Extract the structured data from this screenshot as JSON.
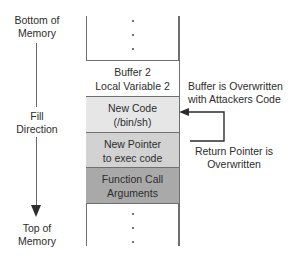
{
  "diagram": {
    "left_labels": {
      "bottom_of_memory": [
        "Bottom of",
        "Memory"
      ],
      "fill_direction": [
        "Fill",
        "Direction"
      ],
      "top_of_memory": [
        "Top of",
        "Memory"
      ]
    },
    "stack": [
      {
        "id": "buffer",
        "lines": [
          "Buffer 2",
          "Local Variable 2"
        ],
        "fill": "#ffffff"
      },
      {
        "id": "new-code",
        "lines": [
          "New Code",
          "(/bin/sh)"
        ],
        "fill": "#e6e6e6"
      },
      {
        "id": "new-pointer",
        "lines": [
          "New Pointer",
          "to exec code"
        ],
        "fill": "#d2d2d2"
      },
      {
        "id": "function-args",
        "lines": [
          "Function Call",
          "Arguments"
        ],
        "fill": "#a9a9a9"
      }
    ],
    "ellipsis": ".",
    "annotations": {
      "buffer_overwritten": [
        "Buffer is Overwritten",
        "with Attackers Code"
      ],
      "return_pointer": [
        "Return Pointer is",
        "Overwritten"
      ]
    },
    "colors": {
      "line": "#6f6f6f",
      "text": "#2d2d2d"
    }
  }
}
